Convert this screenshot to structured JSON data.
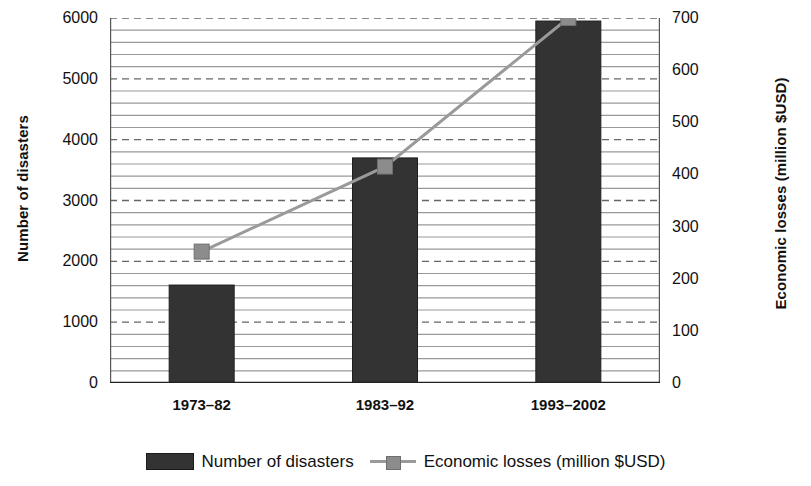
{
  "chart_data": {
    "type": "bar",
    "title": "",
    "subtitle": "",
    "categories": [
      "1973–82",
      "1983–92",
      "1993–2002"
    ],
    "xlabel": "",
    "ylabel": "Number of disasters",
    "y2label": "Economic losses (million $USD)",
    "ylim": [
      0,
      6000
    ],
    "y2lim": [
      0,
      700
    ],
    "yticks": [
      0,
      1000,
      2000,
      3000,
      4000,
      5000,
      6000
    ],
    "ytick_labels": [
      "0",
      "1000",
      "2000",
      "3000",
      "4000",
      "5000",
      "6000"
    ],
    "y2ticks": [
      0,
      100,
      200,
      300,
      400,
      500,
      600,
      700
    ],
    "y2tick_labels": [
      "0",
      "100",
      "200",
      "300",
      "400",
      "500",
      "600",
      "700"
    ],
    "y_minor_step": 200,
    "y2_minor_step": 25,
    "grid": true,
    "grid_major_style": "dashed",
    "grid_minor_style": "solid",
    "legend_position": "bottom",
    "series": [
      {
        "name": "Number of disasters",
        "type": "bar",
        "axis": "left",
        "color": "#333333",
        "values": [
          1610,
          3700,
          5950
        ]
      },
      {
        "name": "Economic losses (million $USD)",
        "type": "line",
        "axis": "right",
        "color": "#9a9a9a",
        "marker_color": "#8c8c8c",
        "values": [
          252,
          415,
          700
        ]
      }
    ]
  },
  "legend": {
    "entries": [
      {
        "label": "Number of disasters",
        "marker": "bar-swatch-icon"
      },
      {
        "label": "Economic losses (million $USD)",
        "marker": "line-marker-icon"
      }
    ]
  },
  "colors": {
    "bar": "#333333",
    "line": "#9a9a9a",
    "marker": "#8c8c8c",
    "grid_major": "#666666",
    "grid_minor": "#999999",
    "axis": "#555555",
    "text": "#111111",
    "background": "#ffffff"
  }
}
